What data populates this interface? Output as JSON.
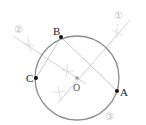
{
  "diagram": {
    "title": "",
    "circle": {
      "center_label": "O",
      "cx": 77,
      "cy": 78,
      "r": 42,
      "stroke": "#8c8c8c"
    },
    "points": [
      {
        "label": "A",
        "x": 117,
        "y": 91
      },
      {
        "label": "B",
        "x": 61,
        "y": 37
      },
      {
        "label": "C",
        "x": 36,
        "y": 78
      }
    ],
    "center": {
      "label": "O",
      "x": 77,
      "y": 78
    },
    "segments": [
      {
        "from": "B",
        "to": "A"
      },
      {
        "from": "B",
        "to": "C"
      }
    ],
    "construction_lines": [
      {
        "label": "①",
        "x1": 130,
        "y1": 20,
        "x2": 58,
        "y2": 103
      },
      {
        "label": "②",
        "x1": 13,
        "y1": 36,
        "x2": 86,
        "y2": 84
      }
    ],
    "step_labels": [
      {
        "text": "①",
        "x": 120,
        "y": 18
      },
      {
        "text": "②",
        "x": 20,
        "y": 32
      },
      {
        "text": "③",
        "x": 111,
        "y": 119
      }
    ],
    "colors": {
      "circle": "#8c8c8c",
      "segments": "#c8c8c8",
      "construction": "#d2d2d2",
      "points": "#111111",
      "labels": "#222222",
      "step_numbers": "#bdbdbd"
    }
  }
}
